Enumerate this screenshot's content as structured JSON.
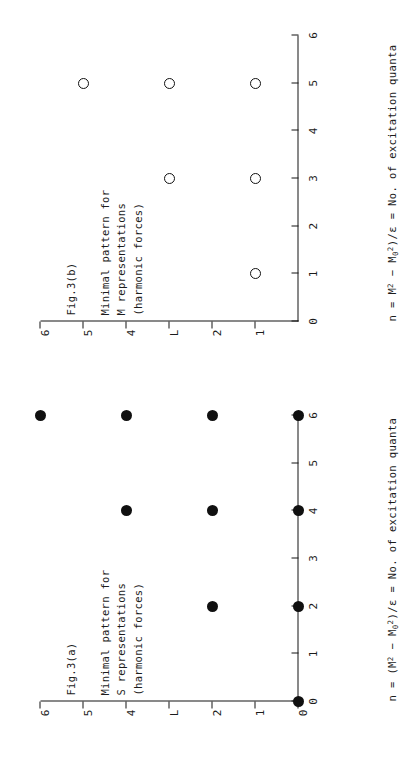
{
  "figure": {
    "orientation": "rotated-90-ccw",
    "background_color": "#ffffff",
    "ink_color": "#141414"
  },
  "panels": [
    {
      "id": "fig-3a",
      "fig_label": "Fig.3(a)",
      "caption_line1": "Minimal pattern for",
      "caption_line2": "S representations",
      "caption_line3": "(harmonic forces)",
      "marker_style": "filled-circle",
      "xlabel_prefix": "n = (M",
      "xlabel_sup1": "2",
      "xlabel_mid": " − M",
      "xlabel_sub": "0",
      "xlabel_sup2": "2",
      "xlabel_suffix": ")/ε = No. of excitation quanta"
    },
    {
      "id": "fig-3b",
      "fig_label": "Fig.3(b)",
      "caption_line1": "Minimal pattern for",
      "caption_line2": "M representations",
      "caption_line3": "(harmonic forces)",
      "marker_style": "open-circle",
      "xlabel_prefix": "n = M",
      "xlabel_sup1": "2",
      "xlabel_mid": " − M",
      "xlabel_sub": "0",
      "xlabel_sup2": "2",
      "xlabel_suffix": ")/ε = No. of excitation quanta"
    }
  ],
  "chart_data": [
    {
      "type": "scatter",
      "title": "Fig.3(a) Minimal pattern for S representations (harmonic forces)",
      "xlabel": "n = (M^2 - M_0^2)/ε = No. of excitation quanta",
      "ylabel": "",
      "xlim": [
        0,
        6
      ],
      "ylim": [
        0,
        6
      ],
      "xticks": [
        0,
        1,
        2,
        3,
        4,
        5,
        6
      ],
      "xticklabels": [
        "0",
        "1",
        "2",
        "3",
        "4",
        "5",
        "6"
      ],
      "yticks": [
        0,
        1,
        2,
        3,
        4,
        5,
        6
      ],
      "yticklabels": [
        "0",
        "1",
        "2",
        "L",
        "4",
        "5",
        "6"
      ],
      "grid": false,
      "legend": "none",
      "marker": "filled circle",
      "points": [
        {
          "x": 0,
          "y": 0
        },
        {
          "x": 2,
          "y": 0
        },
        {
          "x": 2,
          "y": 2
        },
        {
          "x": 4,
          "y": 0
        },
        {
          "x": 4,
          "y": 2
        },
        {
          "x": 4,
          "y": 4
        },
        {
          "x": 6,
          "y": 0
        },
        {
          "x": 6,
          "y": 2
        },
        {
          "x": 6,
          "y": 4
        },
        {
          "x": 6,
          "y": 6
        }
      ]
    },
    {
      "type": "scatter",
      "title": "Fig.3(b) Minimal pattern for M representations (harmonic forces)",
      "xlabel": "n = M^2 - M_0^2)/ε = No. of excitation quanta",
      "ylabel": "",
      "xlim": [
        0,
        6
      ],
      "ylim": [
        0,
        6
      ],
      "xticks": [
        0,
        1,
        2,
        3,
        4,
        5,
        6
      ],
      "xticklabels": [
        "0",
        "1",
        "2",
        "3",
        "4",
        "5",
        "6"
      ],
      "yticks": [
        1,
        2,
        3,
        4,
        5,
        6
      ],
      "yticklabels": [
        "1",
        "2",
        "L",
        "4",
        "5",
        "6"
      ],
      "grid": false,
      "legend": "none",
      "marker": "open circle",
      "points": [
        {
          "x": 1,
          "y": 1
        },
        {
          "x": 3,
          "y": 1
        },
        {
          "x": 3,
          "y": 3
        },
        {
          "x": 5,
          "y": 1
        },
        {
          "x": 5,
          "y": 3
        },
        {
          "x": 5,
          "y": 5
        }
      ]
    }
  ]
}
